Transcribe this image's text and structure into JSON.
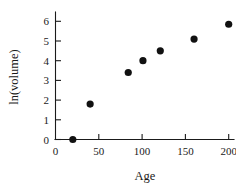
{
  "chart_data": {
    "type": "scatter",
    "title": "",
    "xlabel": "Age",
    "ylabel": "ln(volume)",
    "xlim": [
      0,
      206
    ],
    "ylim": [
      0,
      6.45
    ],
    "xticks": [
      0,
      50,
      100,
      150,
      200
    ],
    "xticklabels": [
      "0",
      "50",
      "100",
      "150",
      "200"
    ],
    "yticks": [
      0,
      1,
      2,
      3,
      4,
      5,
      6
    ],
    "yticklabels": [
      "0",
      "1",
      "2",
      "3",
      "4",
      "5",
      "6"
    ],
    "grid": false,
    "legend": null,
    "marker": "filled-circle",
    "marker_color": "#111111",
    "x": [
      20,
      40,
      84,
      101,
      121,
      160,
      200
    ],
    "y": [
      0.0,
      1.8,
      3.4,
      4.0,
      4.5,
      5.1,
      5.85
    ],
    "points": [
      {
        "x": 20,
        "y": 0.0
      },
      {
        "x": 40,
        "y": 1.8
      },
      {
        "x": 84,
        "y": 3.4
      },
      {
        "x": 101,
        "y": 4.0
      },
      {
        "x": 121,
        "y": 4.5
      },
      {
        "x": 160,
        "y": 5.1
      },
      {
        "x": 200,
        "y": 5.85
      }
    ]
  },
  "axes": {
    "x_axis_label": "Age",
    "y_axis_label": "ln(volume)"
  }
}
